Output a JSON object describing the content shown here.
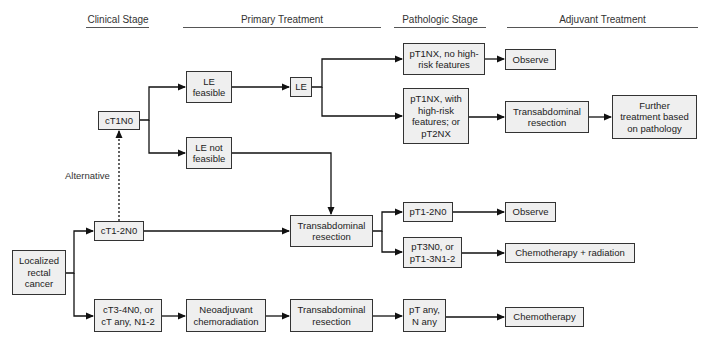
{
  "headers": {
    "clinical_stage": "Clinical Stage",
    "primary_treatment": "Primary Treatment",
    "pathologic_stage": "Pathologic Stage",
    "adjuvant_treatment": "Adjuvant Treatment"
  },
  "nodes": {
    "localized": "Localized\nrectal\ncancer",
    "ct1n0": "cT1N0",
    "ct12n0": "cT1-2N0",
    "ct34n0": "cT3-4N0, or\ncT any, N1-2",
    "le_feasible": "LE\nfeasible",
    "le_not_feasible": "LE not\nfeasible",
    "le": "LE",
    "neoadjuvant": "Neoadjuvant\nchemoradiation",
    "transab_mid": "Transabdominal\nresection",
    "transab_bottom": "Transabdominal\nresection",
    "pt1nx_no": "pT1NX, no high-\nrisk features",
    "pt1nx_with": "pT1NX, with\nhigh-risk\nfeatures; or\npT2NX",
    "pt12n0": "pT1-2N0",
    "pt3n0": "pT3N0, or\npT1-3N1-2",
    "pt_any": "pT any,\nN any",
    "observe_1": "Observe",
    "transab_adj": "Transabdominal\nresection",
    "further": "Further\ntreatment based\non pathology",
    "observe_2": "Observe",
    "chemo_rad": "Chemotherapy + radiation",
    "chemo": "Chemotherapy"
  },
  "labels": {
    "alternative": "Alternative"
  },
  "colors": {
    "box_fill": "#efefef",
    "box_border": "#333333",
    "line": "#111111"
  }
}
